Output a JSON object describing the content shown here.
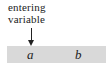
{
  "diagram": {
    "label_line1": "entering",
    "label_line2": "variable",
    "arrow": "down-arrow",
    "bar_color": "#d9d9d9",
    "variables": [
      "a",
      "b"
    ]
  }
}
